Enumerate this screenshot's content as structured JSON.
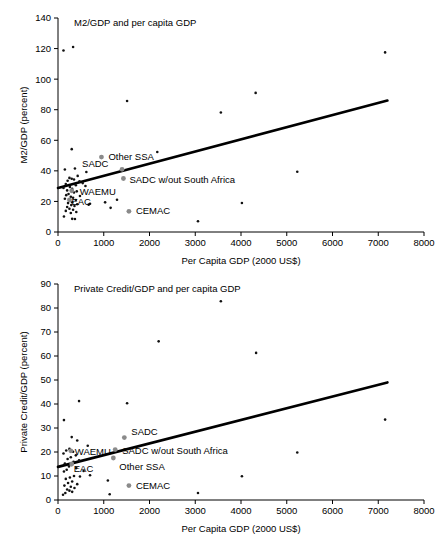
{
  "figure": {
    "background": "#ffffff",
    "marker_color": "#111111",
    "highlight_marker_color": "#8a8a8a",
    "trendline_color": "#000000"
  },
  "chart_data": [
    {
      "type": "scatter",
      "title": "M2/GDP and per capita GDP",
      "xlabel": "Per Capita GDP (2000 US$)",
      "ylabel": "M2/GDP (percent)",
      "xlim": [
        0,
        8000
      ],
      "ylim": [
        0,
        140
      ],
      "xticks": [
        0,
        1000,
        2000,
        3000,
        4000,
        5000,
        6000,
        7000,
        8000
      ],
      "yticks": [
        0,
        20,
        40,
        60,
        80,
        100,
        120,
        140
      ],
      "grid": false,
      "legend": "none",
      "trendline": {
        "x": [
          0,
          7200
        ],
        "y": [
          28.8,
          86.0
        ]
      },
      "points": [
        [
          120,
          118.7
        ],
        [
          330,
          121.0
        ],
        [
          7150,
          117.5
        ],
        [
          4320,
          91.0
        ],
        [
          1510,
          85.7
        ],
        [
          3560,
          78.2
        ],
        [
          2170,
          52.3
        ],
        [
          300,
          54.2
        ],
        [
          5230,
          39.4
        ],
        [
          150,
          40.9
        ],
        [
          370,
          41.5
        ],
        [
          620,
          39.3
        ],
        [
          430,
          36.7
        ],
        [
          250,
          35.4
        ],
        [
          300,
          34.8
        ],
        [
          350,
          34.3
        ],
        [
          210,
          33.5
        ],
        [
          470,
          33.2
        ],
        [
          540,
          32.0
        ],
        [
          170,
          31.4
        ],
        [
          390,
          30.6
        ],
        [
          600,
          30.1
        ],
        [
          260,
          29.4
        ],
        [
          120,
          28.8
        ],
        [
          310,
          28.2
        ],
        [
          200,
          27.2
        ],
        [
          410,
          26.6
        ],
        [
          350,
          25.8
        ],
        [
          230,
          24.9
        ],
        [
          180,
          24.1
        ],
        [
          480,
          23.6
        ],
        [
          280,
          23.0
        ],
        [
          330,
          22.4
        ],
        [
          150,
          21.8
        ],
        [
          260,
          21.3
        ],
        [
          390,
          20.9
        ],
        [
          1290,
          21.1
        ],
        [
          1030,
          19.4
        ],
        [
          700,
          18.5
        ],
        [
          670,
          17.9
        ],
        [
          4020,
          19.0
        ],
        [
          310,
          19.5
        ],
        [
          220,
          18.9
        ],
        [
          420,
          18.2
        ],
        [
          290,
          17.6
        ],
        [
          360,
          17.0
        ],
        [
          200,
          16.4
        ],
        [
          1150,
          15.8
        ],
        [
          250,
          15.2
        ],
        [
          330,
          14.6
        ],
        [
          170,
          13.8
        ],
        [
          400,
          13.1
        ],
        [
          280,
          12.4
        ],
        [
          130,
          10.1
        ],
        [
          310,
          8.6
        ],
        [
          370,
          8.5
        ],
        [
          3060,
          7.0
        ]
      ],
      "highlights": [
        {
          "label": "Other SSA",
          "x": 950,
          "y": 49.0,
          "label_dx": 7,
          "label_dy": 3
        },
        {
          "label": "SADC",
          "x": 1400,
          "y": 41.0,
          "label_dx": -40,
          "label_dy": -2
        },
        {
          "label": "SADC w/out South Africa",
          "x": 1430,
          "y": 35.0,
          "label_dx": 6,
          "label_dy": 4
        },
        {
          "label": "WAEMU",
          "x": 300,
          "y": 27.0,
          "label_dx": 8,
          "label_dy": 4
        },
        {
          "label": "EAC",
          "x": 250,
          "y": 21.0,
          "label_dx": 2,
          "label_dy": 5
        },
        {
          "label": "CEMAC",
          "x": 1550,
          "y": 13.5,
          "label_dx": 7,
          "label_dy": 3
        }
      ]
    },
    {
      "type": "scatter",
      "title": "Private Credit/GDP and per capita GDP",
      "xlabel": "Per Capita GDP (2000 US$)",
      "ylabel": "Private Credit/GDP (percent)",
      "xlim": [
        0,
        8000
      ],
      "ylim": [
        0,
        90
      ],
      "xticks": [
        0,
        1000,
        2000,
        3000,
        4000,
        5000,
        6000,
        7000,
        8000
      ],
      "yticks": [
        0,
        10,
        20,
        30,
        40,
        50,
        60,
        70,
        80,
        90
      ],
      "grid": false,
      "legend": "none",
      "trendline": {
        "x": [
          0,
          7200
        ],
        "y": [
          13.8,
          49.0
        ]
      },
      "points": [
        [
          3560,
          82.8
        ],
        [
          2200,
          66.1
        ],
        [
          4330,
          61.3
        ],
        [
          7150,
          33.5
        ],
        [
          1510,
          40.3
        ],
        [
          460,
          41.2
        ],
        [
          130,
          33.3
        ],
        [
          5230,
          19.8
        ],
        [
          4020,
          9.9
        ],
        [
          300,
          26.2
        ],
        [
          420,
          24.8
        ],
        [
          650,
          22.6
        ],
        [
          250,
          21.3
        ],
        [
          180,
          20.6
        ],
        [
          330,
          20.1
        ],
        [
          120,
          19.4
        ],
        [
          390,
          18.6
        ],
        [
          280,
          17.8
        ],
        [
          210,
          17.1
        ],
        [
          460,
          16.5
        ],
        [
          340,
          15.9
        ],
        [
          150,
          15.2
        ],
        [
          300,
          14.6
        ],
        [
          240,
          14.0
        ],
        [
          400,
          13.3
        ],
        [
          190,
          12.6
        ],
        [
          130,
          11.9
        ],
        [
          700,
          10.3
        ],
        [
          350,
          10.0
        ],
        [
          260,
          9.4
        ],
        [
          170,
          8.8
        ],
        [
          1090,
          8.1
        ],
        [
          310,
          7.7
        ],
        [
          220,
          7.1
        ],
        [
          420,
          6.6
        ],
        [
          140,
          6.0
        ],
        [
          280,
          5.5
        ],
        [
          360,
          5.0
        ],
        [
          200,
          4.4
        ],
        [
          250,
          3.9
        ],
        [
          310,
          3.4
        ],
        [
          160,
          2.9
        ],
        [
          1130,
          2.4
        ],
        [
          110,
          2.2
        ],
        [
          3060,
          2.9
        ],
        [
          480,
          9.8
        ],
        [
          560,
          12.1
        ]
      ],
      "highlights": [
        {
          "label": "SADC",
          "x": 1450,
          "y": 26.0,
          "label_dx": 7,
          "label_dy": -3
        },
        {
          "label": "SADC w/out South Africa",
          "x": 1250,
          "y": 21.0,
          "label_dx": 7,
          "label_dy": 4
        },
        {
          "label": "WAEMU",
          "x": 280,
          "y": 20.5,
          "label_dx": 4,
          "label_dy": 4
        },
        {
          "label": "Other SSA",
          "x": 1210,
          "y": 17.5,
          "label_dx": 0,
          "label_dy": 12
        },
        {
          "label": "EAC",
          "x": 300,
          "y": 15.0,
          "label_dx": 2,
          "label_dy": 8
        },
        {
          "label": "CEMAC",
          "x": 1550,
          "y": 6.0,
          "label_dx": 7,
          "label_dy": 3
        }
      ]
    }
  ]
}
